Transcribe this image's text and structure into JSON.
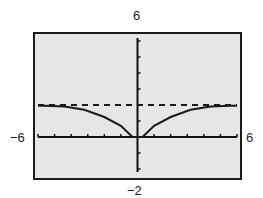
{
  "chart_data": {
    "type": "line",
    "title": "",
    "xlabel": "",
    "ylabel": "",
    "xlim": [
      -6,
      6
    ],
    "ylim": [
      -2,
      6
    ],
    "x_tick_spacing": 1,
    "y_tick_spacing": 1,
    "grid": false,
    "legend": null,
    "window_labels": {
      "xmin": "−6",
      "xmax": "6",
      "ymin": "−2",
      "ymax": "6"
    },
    "series": [
      {
        "name": "f(x)",
        "style": "solid",
        "x": [
          -6,
          -5.6,
          -4.4,
          -3.2,
          -2,
          -1,
          -0.3,
          0.3,
          1,
          2,
          3.2,
          4.4,
          5.6,
          6
        ],
        "y": [
          1.95,
          1.95,
          1.9,
          1.7,
          1.25,
          0.7,
          0,
          0,
          0.7,
          1.25,
          1.7,
          1.9,
          1.95,
          1.95
        ]
      },
      {
        "name": "horizontal asymptote y = 2",
        "style": "dashed",
        "x": [
          -6,
          6
        ],
        "y": [
          2,
          2
        ]
      }
    ],
    "colors": {
      "background": "#e6e6e6",
      "frame": "#1a1a1a",
      "curve": "#1a1a1a"
    }
  }
}
